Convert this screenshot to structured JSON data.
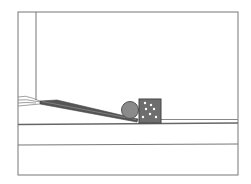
{
  "scene": {
    "title": "",
    "colors": {
      "background": "#ffffff",
      "line": "#707070",
      "ramp": "#606060",
      "ball": "#8a8a8a",
      "box": "#6e6e6e",
      "box_dots": "#ffffff"
    },
    "objects": [
      "frame",
      "wall",
      "ramp",
      "ball",
      "box",
      "ground",
      "ledge",
      "hand"
    ]
  }
}
